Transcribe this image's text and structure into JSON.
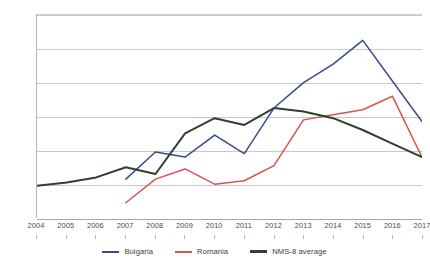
{
  "chart_data": {
    "type": "line",
    "title": "",
    "xlabel": "",
    "ylabel": "",
    "x": [
      2004,
      2005,
      2006,
      2007,
      2008,
      2009,
      2010,
      2011,
      2012,
      2013,
      2014,
      2015,
      2016,
      2017
    ],
    "categories": [
      "2004",
      "2005",
      "2006",
      "2007",
      "2008",
      "2009",
      "2010",
      "2011",
      "2012",
      "2013",
      "2014",
      "2015",
      "2016",
      "2017"
    ],
    "xlim": [
      2004,
      2017
    ],
    "ylim": [
      0.0,
      6.0
    ],
    "ytick_labels": [
      "0.0",
      "1.0",
      "2.0",
      "3.0",
      "4.0",
      "5.0",
      "6.0"
    ],
    "yticks": [
      0.0,
      1.0,
      2.0,
      3.0,
      4.0,
      5.0,
      6.0
    ],
    "grid": true,
    "legend_position": "bottom",
    "series": [
      {
        "name": "Bulgaria",
        "color": "#3b4a8c",
        "x": [
          2007,
          2008,
          2009,
          2010,
          2011,
          2012,
          2013,
          2014,
          2015,
          2016,
          2017
        ],
        "values": [
          1.15,
          1.95,
          1.8,
          2.45,
          1.9,
          3.25,
          4.0,
          4.55,
          5.25,
          4.05,
          2.85
        ]
      },
      {
        "name": "Romania",
        "color": "#d9534f",
        "x": [
          2007,
          2008,
          2009,
          2010,
          2011,
          2012,
          2013,
          2014,
          2015,
          2016,
          2017
        ],
        "values": [
          0.45,
          1.15,
          1.45,
          1.0,
          1.1,
          1.55,
          2.9,
          3.05,
          3.2,
          3.6,
          1.8
        ]
      },
      {
        "name": "NMS-8 average",
        "color": "#2f4030",
        "x": [
          2004,
          2005,
          2006,
          2007,
          2008,
          2009,
          2010,
          2011,
          2012,
          2013,
          2014,
          2015,
          2016,
          2017
        ],
        "values": [
          0.95,
          1.05,
          1.2,
          1.5,
          1.3,
          2.5,
          2.95,
          2.75,
          3.25,
          3.15,
          2.95,
          2.6,
          2.2,
          1.8
        ]
      }
    ]
  },
  "legend": {
    "items": [
      {
        "label": "Bulgaria",
        "color": "#3b4a8c"
      },
      {
        "label": "Romania",
        "color": "#d9534f"
      },
      {
        "label": "NMS-8 average",
        "color": "#2f4030"
      }
    ]
  }
}
